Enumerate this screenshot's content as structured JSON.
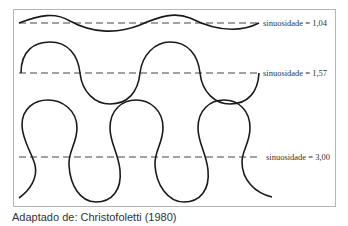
{
  "figure": {
    "rows": [
      {
        "id": "low",
        "label": "sinuosidade = 1,04",
        "sinuosity": 1.04
      },
      {
        "id": "medium",
        "label": "sinuosidade = 1,57",
        "sinuosity": 1.57
      },
      {
        "id": "high",
        "label": "sinuosidade = 3,00",
        "sinuosity": 3.0
      }
    ]
  },
  "caption": "Adaptado de: Christofoletti (1980)"
}
